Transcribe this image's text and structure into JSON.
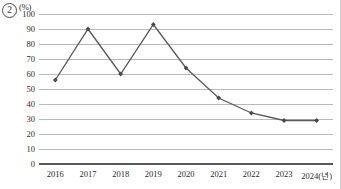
{
  "item_marker": {
    "label": "2"
  },
  "chart_data": {
    "type": "line",
    "title": "",
    "subtitle": "",
    "xlabel": "",
    "ylabel": "",
    "unit_label": "(%)",
    "x_axis_suffix_label": "2024(년)",
    "categories": [
      "2016",
      "2017",
      "2018",
      "2019",
      "2020",
      "2021",
      "2022",
      "2023",
      "2024"
    ],
    "x_tick_labels": [
      "2016",
      "2017",
      "2018",
      "2019",
      "2020",
      "2021",
      "2022",
      "2023",
      "2024(년)"
    ],
    "values": [
      56,
      90,
      60,
      93,
      64,
      44,
      34,
      29,
      29
    ],
    "series": [
      {
        "name": "",
        "values": [
          56,
          90,
          60,
          93,
          64,
          44,
          34,
          29,
          29
        ]
      }
    ],
    "ylim": [
      0,
      100
    ],
    "ytick_labels": [
      "0",
      "10",
      "20",
      "30",
      "40",
      "50",
      "60",
      "70",
      "80",
      "90",
      "100"
    ],
    "ytick_values": [
      0,
      10,
      20,
      30,
      40,
      50,
      60,
      70,
      80,
      90,
      100
    ],
    "grid": "horizontal",
    "legend": "none",
    "marker": "diamond",
    "line_color": "#595959",
    "marker_color": "#4a4a4a",
    "grid_color": "#b9b9b9",
    "axis_color": "#585858"
  }
}
